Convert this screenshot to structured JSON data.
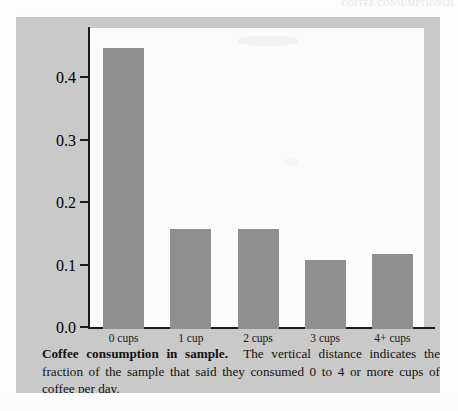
{
  "running_head": {
    "text": "COFFEE CONSUMPTION",
    "page_number": "121"
  },
  "chart_data": {
    "type": "bar",
    "title": "Coffee consumption in sample",
    "xlabel": "",
    "ylabel": "",
    "categories": [
      "0 cups",
      "1 cup",
      "2 cups",
      "3 cups",
      "4+ cups"
    ],
    "values": [
      0.45,
      0.16,
      0.16,
      0.11,
      0.12
    ],
    "ylim": [
      0.0,
      0.47
    ],
    "yticks": [
      "0.0",
      "0.1",
      "0.2",
      "0.3",
      "0.4"
    ],
    "ytick_values": [
      0.0,
      0.1,
      0.2,
      0.3,
      0.4
    ],
    "grid": false,
    "legend": false,
    "bar_color": "#8f8f8f",
    "axis_color": "#1c1c1c",
    "panel_color": "#c9c9c9",
    "canvas_color": "#fbfbfb"
  },
  "caption": {
    "title": "Coffee consumption in sample",
    "title_suffix": ".",
    "body": "The vertical distance indicates the fraction of the sample that said they consumed 0 to 4 or more cups of coffee per day."
  }
}
